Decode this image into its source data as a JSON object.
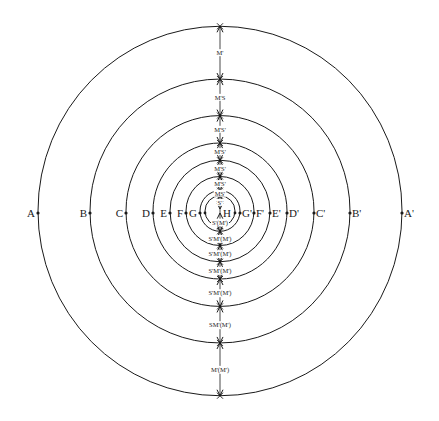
{
  "diagram": {
    "type": "concentric-circles",
    "center": {
      "x": 220,
      "y": 211
    },
    "stroke_color": "#1a1a1a",
    "background": "#ffffff",
    "circles": [
      {
        "name": "A",
        "r": 182,
        "left_label": "A",
        "right_label": "A'"
      },
      {
        "name": "B",
        "r": 130,
        "left_label": "B",
        "right_label": "B'"
      },
      {
        "name": "C",
        "r": 94,
        "left_label": "C",
        "right_label": "C'"
      },
      {
        "name": "D",
        "r": 67,
        "left_label": "D",
        "right_label": "D'"
      },
      {
        "name": "E",
        "r": 50,
        "left_label": "E",
        "right_label": "E'"
      },
      {
        "name": "F",
        "r": 34,
        "left_label": "F",
        "right_label": "F'"
      },
      {
        "name": "G",
        "r": 20,
        "left_label": "G",
        "right_label": "G'"
      },
      {
        "name": "H",
        "r": 15,
        "left_label": "",
        "right_label": ""
      }
    ],
    "center_label": "H",
    "upper_segments": [
      {
        "label": "M'"
      },
      {
        "label": "M'S"
      },
      {
        "label": "M'S'"
      },
      {
        "label": "M'S'"
      },
      {
        "label": "M'S'"
      },
      {
        "label": "M'S'"
      },
      {
        "label": "MS'"
      },
      {
        "label": "S'"
      }
    ],
    "lower_segments": [
      {
        "label": "S'(M')"
      },
      {
        "label": "S'M'(M')"
      },
      {
        "label": "S'M'(M')"
      },
      {
        "label": "S'M'(M')"
      },
      {
        "label": "S'M'(M')"
      },
      {
        "label": "SM'(M')"
      },
      {
        "label": "M'(M')"
      }
    ]
  }
}
